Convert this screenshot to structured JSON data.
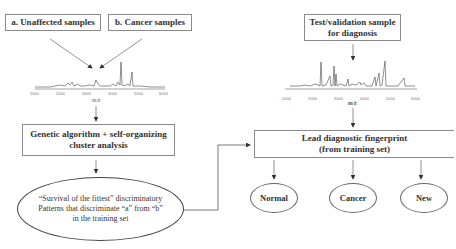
{
  "left": {
    "box_a": "a. Unaffected samples",
    "box_b": "b. Cancer samples",
    "spectrum": {
      "ticks": [
        "1000",
        "2000",
        "3000",
        "4000",
        "5000",
        "6000"
      ],
      "axis_label": "m/z"
    },
    "algorithm_box": {
      "line1": "Genetic algorithm + self-organizing",
      "line2": "cluster analysis"
    },
    "pattern_ellipse": {
      "line1": "“Survival of the fittest” discriminatory",
      "line2": "Patterns that discriminate “a” from “b”",
      "line3": "in the training set"
    }
  },
  "right": {
    "test_box": {
      "line1": "Test/validation sample",
      "line2": "for diagnosis"
    },
    "spectrum": {
      "ticks": [
        "1000",
        "2000",
        "3000",
        "4000",
        "5000",
        "6000"
      ],
      "axis_label": "m/z"
    },
    "lead_box": {
      "line1": "Lead diagnostic fingerprint",
      "line2": "(from training set)"
    },
    "outcomes": [
      "Normal",
      "Cancer",
      "New"
    ]
  },
  "colors": {
    "line": "#555555",
    "box_border": "#8a8a8a",
    "text": "#333333"
  }
}
